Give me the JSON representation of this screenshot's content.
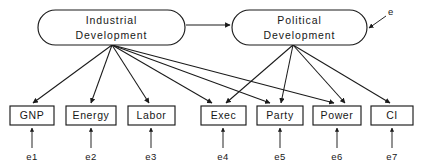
{
  "diagram": {
    "type": "structural-equation-path-diagram",
    "title": "",
    "background_color": "#ffffff",
    "stroke_color": "#1a1a1a",
    "text_color": "#171717",
    "latent_variables": [
      {
        "id": "industrial-development",
        "label_line1": "Industrial",
        "label_line2": "Development",
        "shape": "rounded-rectangle",
        "x": 38,
        "y": 10,
        "width": 147,
        "height": 35
      },
      {
        "id": "political-development",
        "label_line1": "Political",
        "label_line2": "Development",
        "shape": "rounded-rectangle",
        "x": 232,
        "y": 10,
        "width": 135,
        "height": 35
      }
    ],
    "observed_variables": [
      {
        "id": "gnp",
        "label": "GNP",
        "x": 10,
        "y": 106,
        "width": 44,
        "height": 19
      },
      {
        "id": "energy",
        "label": "Energy",
        "x": 66,
        "y": 106,
        "width": 50,
        "height": 19
      },
      {
        "id": "labor",
        "label": "Labor",
        "x": 128,
        "y": 106,
        "width": 47,
        "height": 19
      },
      {
        "id": "exec",
        "label": "Exec",
        "x": 201,
        "y": 106,
        "width": 45,
        "height": 19
      },
      {
        "id": "party",
        "label": "Party",
        "x": 257,
        "y": 106,
        "width": 46,
        "height": 19
      },
      {
        "id": "power",
        "label": "Power",
        "x": 313,
        "y": 106,
        "width": 48,
        "height": 19
      },
      {
        "id": "ci",
        "label": "CI",
        "x": 371,
        "y": 106,
        "width": 42,
        "height": 19
      }
    ],
    "error_terms": [
      {
        "id": "e1",
        "label": "e1",
        "x": 32,
        "y": 157,
        "target": "gnp"
      },
      {
        "id": "e2",
        "label": "e2",
        "x": 91,
        "y": 157,
        "target": "energy"
      },
      {
        "id": "e3",
        "label": "e3",
        "x": 151,
        "y": 157,
        "target": "labor"
      },
      {
        "id": "e4",
        "label": "e4",
        "x": 223,
        "y": 157,
        "target": "exec"
      },
      {
        "id": "e5",
        "label": "e5",
        "x": 280,
        "y": 157,
        "target": "party"
      },
      {
        "id": "e6",
        "label": "e6",
        "x": 337,
        "y": 157,
        "target": "power"
      },
      {
        "id": "e7",
        "label": "e7",
        "x": 392,
        "y": 157,
        "target": "ci"
      }
    ],
    "disturbance": {
      "id": "e",
      "label": "e",
      "x": 389,
      "y": 12,
      "target": "political-development"
    },
    "structural_path": {
      "from": "industrial-development",
      "to": "political-development",
      "label": ""
    },
    "measurement_paths": [
      {
        "from": "industrial-development",
        "to": "gnp"
      },
      {
        "from": "industrial-development",
        "to": "energy"
      },
      {
        "from": "industrial-development",
        "to": "labor"
      },
      {
        "from": "industrial-development",
        "to": "exec"
      },
      {
        "from": "industrial-development",
        "to": "party"
      },
      {
        "from": "industrial-development",
        "to": "power"
      },
      {
        "from": "political-development",
        "to": "exec"
      },
      {
        "from": "political-development",
        "to": "party"
      },
      {
        "from": "political-development",
        "to": "power"
      },
      {
        "from": "political-development",
        "to": "ci"
      }
    ]
  }
}
